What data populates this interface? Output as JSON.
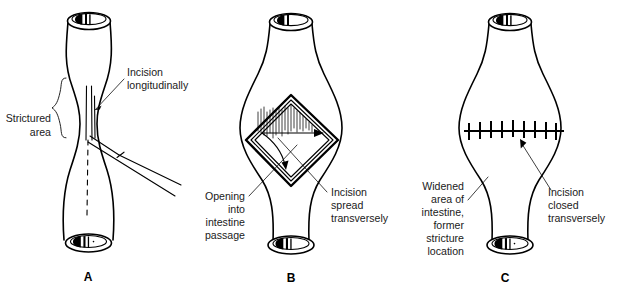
{
  "figure": {
    "background_color": "#ffffff",
    "ink_color": "#000000",
    "panels": [
      {
        "letter": "A",
        "name": "incision",
        "labels": [
          {
            "id": "strictured-area",
            "lines": [
              "Strictured",
              "area"
            ],
            "align": "right",
            "marker": "curly-brace"
          },
          {
            "id": "incision-longitudinally",
            "lines": [
              "Incision",
              "longitudinally"
            ],
            "align": "left",
            "marker": "leader-line"
          }
        ],
        "instrument": "scalpel"
      },
      {
        "letter": "B",
        "name": "opening-spread",
        "labels": [
          {
            "id": "opening-into-intestine-passage",
            "lines": [
              "Opening",
              "into",
              "intestine",
              "passage"
            ],
            "align": "right",
            "marker": "leader-line"
          },
          {
            "id": "incision-spread-transversely",
            "lines": [
              "Incision",
              "spread",
              "transversely"
            ],
            "align": "left",
            "marker": "leader-line"
          }
        ],
        "feature": "diamond-opening-hatched"
      },
      {
        "letter": "C",
        "name": "closure",
        "labels": [
          {
            "id": "widened-area",
            "lines": [
              "Widened",
              "area of",
              "intestine,",
              "former",
              "stricture",
              "location"
            ],
            "align": "right",
            "marker": "leader-line"
          },
          {
            "id": "incision-closed-transversely",
            "lines": [
              "Incision",
              "closed",
              "transversely"
            ],
            "align": "left",
            "marker": "leader-line"
          }
        ],
        "feature": "transverse-suture-line",
        "suture_count": 10
      }
    ]
  },
  "labels": {
    "a_strictured_1": "Strictured",
    "a_strictured_2": "area",
    "a_incision_1": "Incision",
    "a_incision_2": "longitudinally",
    "b_opening_1": "Opening",
    "b_opening_2": "into",
    "b_opening_3": "intestine",
    "b_opening_4": "passage",
    "b_spread_1": "Incision",
    "b_spread_2": "spread",
    "b_spread_3": "transversely",
    "c_widened_1": "Widened",
    "c_widened_2": "area of",
    "c_widened_3": "intestine,",
    "c_widened_4": "former",
    "c_widened_5": "stricture",
    "c_widened_6": "location",
    "c_closed_1": "Incision",
    "c_closed_2": "closed",
    "c_closed_3": "transversely",
    "letter_a": "A",
    "letter_b": "B",
    "letter_c": "C"
  }
}
